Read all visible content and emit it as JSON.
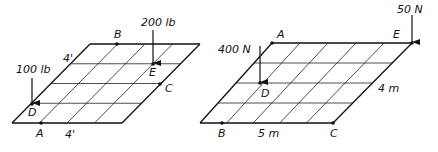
{
  "figures": [
    {
      "id": "left",
      "units": "ft",
      "grid": {
        "cols": 4,
        "rows": 4,
        "top_left": [
          90,
          44
        ],
        "top_right": [
          200,
          44
        ],
        "bottom_left": [
          12,
          123
        ],
        "bottom_right": [
          122,
          123
        ]
      },
      "points": [
        {
          "label": "A",
          "x": 41,
          "y": 123,
          "lx": 36,
          "ly": 137
        },
        {
          "label": "B",
          "x": 117,
          "y": 44,
          "lx": 114,
          "ly": 38
        },
        {
          "label": "C",
          "x": 160,
          "y": 84,
          "lx": 165,
          "ly": 92
        },
        {
          "label": "D",
          "x": 32,
          "y": 104,
          "lx": 28,
          "ly": 116
        },
        {
          "label": "E",
          "x": 153,
          "y": 64,
          "lx": 149,
          "ly": 76
        }
      ],
      "forces": [
        {
          "label": "100 lb",
          "x": 32,
          "y_from": 78,
          "y_to": 103,
          "lx": 16,
          "ly": 73
        },
        {
          "label": "200 lb",
          "x": 153,
          "y_from": 30,
          "y_to": 63,
          "lx": 141,
          "ly": 26
        }
      ],
      "dims": [
        {
          "label": "4'",
          "x": 63,
          "y": 62
        },
        {
          "label": "4'",
          "x": 65,
          "y": 138
        }
      ]
    },
    {
      "id": "right",
      "units": "SI",
      "grid": {
        "cols": 5,
        "rows": 4,
        "top_left": [
          272,
          43
        ],
        "top_right": [
          412,
          43
        ],
        "bottom_left": [
          200,
          123
        ],
        "bottom_right": [
          333,
          123
        ]
      },
      "points": [
        {
          "label": "A",
          "x": 272,
          "y": 43,
          "lx": 277,
          "ly": 38
        },
        {
          "label": "B",
          "x": 222,
          "y": 123,
          "lx": 218,
          "ly": 137
        },
        {
          "label": "C",
          "x": 333,
          "y": 123,
          "lx": 330,
          "ly": 137
        },
        {
          "label": "D",
          "x": 260,
          "y": 83,
          "lx": 261,
          "ly": 97
        },
        {
          "label": "E",
          "x": 412,
          "y": 43,
          "lx": 393,
          "ly": 38
        }
      ],
      "forces": [
        {
          "label": "400 N",
          "x": 260,
          "y_from": 46,
          "y_to": 82,
          "lx": 218,
          "ly": 53
        },
        {
          "label": "50 N",
          "x": 412,
          "y_from": 15,
          "y_to": 42,
          "lx": 397,
          "ly": 13
        }
      ],
      "dims": [
        {
          "label": "5 m",
          "x": 258,
          "y": 137
        },
        {
          "label": "4 m",
          "x": 378,
          "y": 92
        }
      ]
    }
  ]
}
